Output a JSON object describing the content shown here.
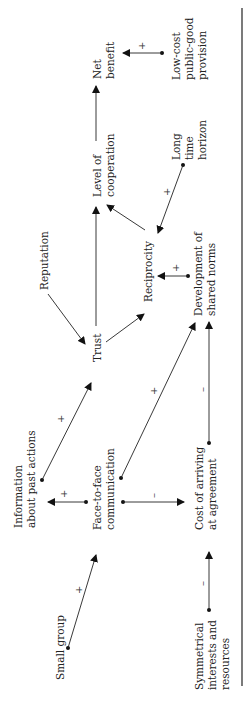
{
  "diagram": {
    "orientation": "rotated-90-ccw",
    "nodes": {
      "small_group": [
        "Small group"
      ],
      "symmetrical": [
        "Symmetrical",
        "interests and",
        "resources"
      ],
      "information": [
        "Information",
        "about past actions"
      ],
      "face_to_face": [
        "Face-to-face",
        "communication"
      ],
      "cost_agreement": [
        "Cost of arriving",
        "at agreement"
      ],
      "trust": [
        "Trust"
      ],
      "reputation": [
        "Reputation"
      ],
      "reciprocity": [
        "Reciprocity"
      ],
      "shared_norms": [
        "Development of",
        "shared norms"
      ],
      "level_cooperation": [
        "Level of",
        "cooperation"
      ],
      "long_horizon": [
        "Long",
        "time",
        "horizon"
      ],
      "net_benefit": [
        "Net",
        "benefit"
      ],
      "low_cost": [
        "Low-cost",
        "public-good",
        "provision"
      ]
    },
    "edges": [
      {
        "from": "Small group",
        "to": "Face-to-face communication",
        "sign": "+"
      },
      {
        "from": "Symmetrical interests and resources",
        "to": "Cost of arriving at agreement",
        "sign": "–"
      },
      {
        "from": "Face-to-face communication",
        "to": "Information about past actions",
        "sign": "+"
      },
      {
        "from": "Face-to-face communication",
        "to": "Cost of arriving at agreement",
        "sign": "–"
      },
      {
        "from": "Face-to-face communication",
        "to": "Development of shared norms",
        "sign": "+"
      },
      {
        "from": "Information about past actions",
        "to": "Trust",
        "sign": "+"
      },
      {
        "from": "Cost of arriving at agreement",
        "to": "Development of shared norms",
        "sign": "–"
      },
      {
        "from": "Reputation",
        "to": "Trust",
        "sign": ""
      },
      {
        "from": "Trust",
        "to": "Reciprocity",
        "sign": ""
      },
      {
        "from": "Trust",
        "to": "Level of cooperation",
        "sign": ""
      },
      {
        "from": "Development of shared norms",
        "to": "Reciprocity",
        "sign": "+"
      },
      {
        "from": "Reciprocity",
        "to": "Level of cooperation",
        "sign": ""
      },
      {
        "from": "Long time horizon",
        "to": "Reciprocity",
        "sign": "+"
      },
      {
        "from": "Level of cooperation",
        "to": "Net benefit",
        "sign": ""
      },
      {
        "from": "Low-cost public-good provision",
        "to": "Net benefit",
        "sign": "+"
      }
    ],
    "signs": {
      "plus": "+",
      "minus": "–"
    }
  }
}
